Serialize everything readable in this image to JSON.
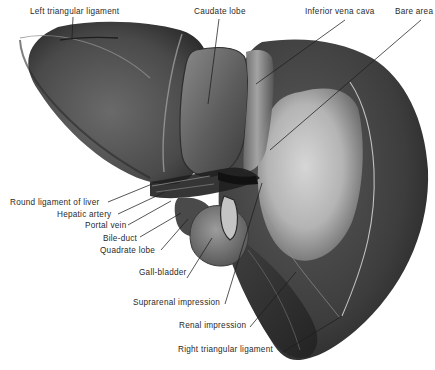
{
  "figure": {
    "colors": {
      "background": "#ffffff",
      "tissue_dark": "#3b3b3b",
      "tissue_mid": "#5e5e5e",
      "tissue_light": "#9a9a9a",
      "bare_area": "#c9c9c9",
      "leader_line": "#1e1e1e",
      "label_text": "#2a2a2a"
    }
  },
  "labels": {
    "left_triangular_ligament": "Left triangular ligament",
    "caudate_lobe": "Caudate lobe",
    "inferior_vena_cava": "Inferior vena cava",
    "bare_area": "Bare area",
    "round_ligament_of_liver": "Round ligament of liver",
    "hepatic_artery": "Hepatic artery",
    "portal_vein": "Portal vein",
    "bile_duct": "Bile-duct",
    "quadrate_lobe": "Quadrate lobe",
    "gall_bladder": "Gall-bladder",
    "suprarenal_impression": "Suprarenal impression",
    "renal_impression": "Renal impression",
    "right_triangular_ligament": "Right triangular ligament"
  }
}
